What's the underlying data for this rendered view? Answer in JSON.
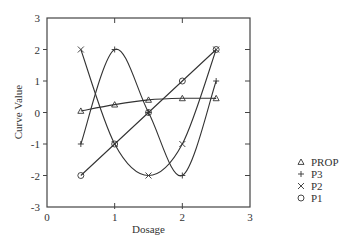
{
  "chart_data": {
    "type": "line",
    "title": "",
    "xlabel": "Dosage",
    "ylabel": "Curve Value",
    "xlim": [
      0,
      3
    ],
    "ylim": [
      -3,
      3
    ],
    "xticks": [
      0,
      1,
      2,
      3
    ],
    "yticks": [
      -3,
      -2,
      -1,
      0,
      1,
      2,
      3
    ],
    "grid": false,
    "legend_position": "right",
    "x": [
      0.5,
      1,
      1.5,
      2,
      2.5
    ],
    "series": [
      {
        "name": "PROP",
        "marker": "triangle",
        "smooth": true,
        "values": [
          0.05,
          0.25,
          0.4,
          0.45,
          0.45
        ]
      },
      {
        "name": "P3",
        "marker": "plus",
        "smooth": true,
        "values": [
          -1,
          2,
          0,
          -2,
          1
        ]
      },
      {
        "name": "P2",
        "marker": "x",
        "smooth": true,
        "values": [
          2,
          -1,
          -2,
          -1,
          2
        ]
      },
      {
        "name": "P1",
        "marker": "circle",
        "smooth": false,
        "values": [
          -2,
          -1,
          0,
          1,
          2
        ]
      }
    ]
  },
  "legend": {
    "items": [
      {
        "symbol": "△",
        "label": "PROP"
      },
      {
        "symbol": "+",
        "label": "P3"
      },
      {
        "symbol": "×",
        "label": "P2"
      },
      {
        "symbol": "○",
        "label": "P1"
      }
    ]
  },
  "style": {
    "line_color": "#333333",
    "axis_color": "#444444"
  }
}
